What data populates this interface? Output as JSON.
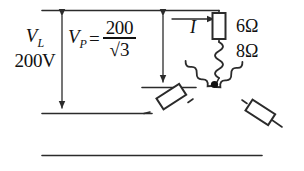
{
  "diagram": {
    "line_color": "#2b2b2b",
    "labels": {
      "v_line_symbol": "V",
      "v_line_sub": "L",
      "v_line_value": "200V",
      "v_phase_symbol": "V",
      "v_phase_sub": "P",
      "equals": "=",
      "numerator": "200",
      "denominator": "√3",
      "current": "I",
      "resistance": "6Ω",
      "reactance": "8Ω"
    },
    "components": {
      "resistor_value": "6Ω",
      "inductor_value": "8Ω",
      "branch_count": 3,
      "connection": "wye"
    }
  }
}
